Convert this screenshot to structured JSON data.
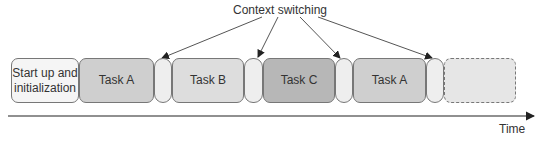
{
  "title": "Context switching",
  "time_label": "Time",
  "segments": [
    {
      "label": "Start up and initialization",
      "type": "init",
      "x": 11,
      "w": 68,
      "color": "#f5f5f5"
    },
    {
      "label": "Task A",
      "type": "task",
      "x": 79,
      "w": 75,
      "color": "#cfcfcf"
    },
    {
      "label": "",
      "type": "switch",
      "x": 154,
      "w": 18,
      "color": "#eeeeee"
    },
    {
      "label": "Task B",
      "type": "task",
      "x": 172,
      "w": 72,
      "color": "#dddddd"
    },
    {
      "label": "",
      "type": "switch",
      "x": 244,
      "w": 19,
      "color": "#eeeeee"
    },
    {
      "label": "Task C",
      "type": "task",
      "x": 263,
      "w": 72,
      "color": "#b7b7b7"
    },
    {
      "label": "",
      "type": "switch",
      "x": 335,
      "w": 18,
      "color": "#eeeeee"
    },
    {
      "label": "Task A",
      "type": "task",
      "x": 353,
      "w": 73,
      "color": "#cfcfcf"
    },
    {
      "label": "",
      "type": "switch",
      "x": 426,
      "w": 18,
      "color": "#eeeeee"
    },
    {
      "label": "",
      "type": "future",
      "x": 444,
      "w": 72,
      "color": "#e6e6e6"
    }
  ],
  "colors": {
    "stroke": "#777777",
    "arrow": "#333333",
    "text": "#333333"
  }
}
